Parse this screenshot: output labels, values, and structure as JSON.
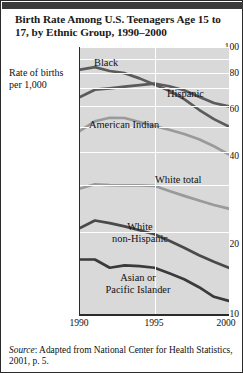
{
  "figure": {
    "title": "Birth Rate Among U.S. Teenagers Age 15 to 17, by Ethnic Group, 1990–2000",
    "source_prefix": "Source",
    "source_text": ": Adapted from National Center for Health Statistics, 2001, p. 5."
  },
  "axes": {
    "ylabel": "Rate of births per 1,000",
    "yticks": [
      "100",
      "80",
      "60",
      "40",
      "20",
      "10"
    ],
    "xticks": [
      "1990",
      "1995",
      "2000"
    ]
  },
  "chart_data": {
    "type": "line",
    "title": "Birth Rate Among U.S. Teenagers Age 15 to 17, by Ethnic Group, 1990–2000",
    "xlabel": "",
    "ylabel": "Rate of births per 1,000",
    "yscale": "log",
    "ylim": [
      10,
      100
    ],
    "ytick_values": [
      100,
      80,
      60,
      40,
      20,
      10
    ],
    "xlim": [
      1990,
      2000
    ],
    "xtick_values": [
      1990,
      1995,
      2000
    ],
    "grid": "horizontal-white-gridlines",
    "legend": "inline-labels",
    "x": [
      1990,
      1991,
      1992,
      1993,
      1994,
      1995,
      1996,
      1997,
      1998,
      1999,
      2000
    ],
    "series": [
      {
        "name": "Black",
        "color": "#5b5b5b",
        "values": [
          82.3,
          84.1,
          81.3,
          79.8,
          76.3,
          72.3,
          68.6,
          63.8,
          58.2,
          53.7,
          50.4
        ]
      },
      {
        "name": "Hispanic",
        "color": "#5b5b5b",
        "values": [
          65.0,
          69.2,
          70.0,
          71.0,
          72.0,
          72.9,
          71.3,
          68.9,
          65.1,
          61.7,
          59.9
        ]
      },
      {
        "name": "American Indian",
        "color": "#9a9a9a",
        "values": [
          48.5,
          52.7,
          54.3,
          54.2,
          52.4,
          50.6,
          49.0,
          47.2,
          45.1,
          42.5,
          39.6
        ]
      },
      {
        "name": "White total",
        "color": "#9a9a9a",
        "values": [
          29.5,
          30.6,
          30.4,
          30.3,
          30.3,
          30.2,
          28.9,
          27.7,
          26.6,
          25.6,
          24.8
        ]
      },
      {
        "name": "White non-Hispanic",
        "color": "#4a4a4a",
        "values": [
          21.0,
          22.4,
          21.9,
          21.3,
          20.6,
          19.9,
          18.8,
          17.7,
          16.6,
          15.7,
          14.9
        ]
      },
      {
        "name": "Asian or Pacific Islander",
        "color": "#3a3a3a",
        "values": [
          16.0,
          16.0,
          14.9,
          15.2,
          15.1,
          14.9,
          14.2,
          13.5,
          12.6,
          11.6,
          11.2
        ]
      }
    ]
  },
  "series_labels": [
    {
      "name": "Black",
      "text": "Black"
    },
    {
      "name": "Hispanic",
      "text": "Hispanic"
    },
    {
      "name": "American Indian",
      "text": "American Indian"
    },
    {
      "name": "White total",
      "text": "White total"
    },
    {
      "name": "White non-Hispanic",
      "line1": "White",
      "line2": "non-Hispanic"
    },
    {
      "name": "Asian or Pacific Islander",
      "line1": "Asian or",
      "line2": "Pacific Islander"
    }
  ]
}
